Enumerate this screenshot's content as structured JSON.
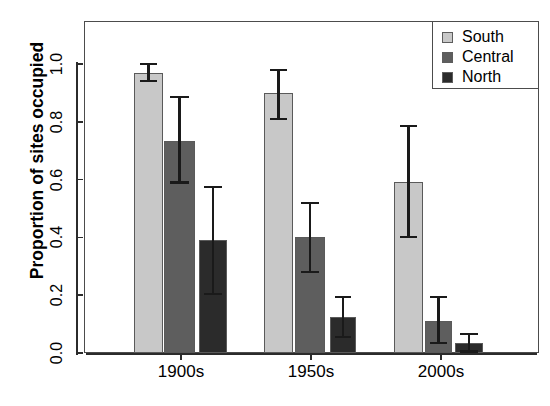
{
  "chart_data": {
    "type": "bar",
    "title": "",
    "xlabel": "",
    "ylabel": "Proportion of sites occupied",
    "categories": [
      "1900s",
      "1950s",
      "2000s"
    ],
    "ylim": [
      0.0,
      1.08
    ],
    "yticks": [
      "0.0",
      "0.2",
      "0.4",
      "0.6",
      "0.8",
      "1.0"
    ],
    "ytick_values": [
      0.0,
      0.2,
      0.4,
      0.6,
      0.8,
      1.0
    ],
    "grid": false,
    "legend_position": "top-right",
    "series": [
      {
        "name": "South",
        "color": "#c8c8c8",
        "values": [
          0.97,
          0.9,
          0.59
        ],
        "err_low": [
          0.94,
          0.81,
          0.4
        ],
        "err_high": [
          1.0,
          0.98,
          0.785
        ]
      },
      {
        "name": "Central",
        "color": "#5e5e5e",
        "values": [
          0.735,
          0.4,
          0.11
        ],
        "err_low": [
          0.59,
          0.28,
          0.035
        ],
        "err_high": [
          0.885,
          0.52,
          0.195
        ]
      },
      {
        "name": "North",
        "color": "#2b2b2b",
        "values": [
          0.39,
          0.125,
          0.035
        ],
        "err_low": [
          0.205,
          0.055,
          0.005
        ],
        "err_high": [
          0.575,
          0.195,
          0.065
        ]
      }
    ]
  },
  "legend": {
    "entries": [
      {
        "label": "South"
      },
      {
        "label": "Central"
      },
      {
        "label": "North"
      }
    ]
  },
  "axes": {
    "y_title": "Proportion of sites occupied",
    "y_ticks": [
      "0.0",
      "0.2",
      "0.4",
      "0.6",
      "0.8",
      "1.0"
    ],
    "x_ticks": [
      "1900s",
      "1950s",
      "2000s"
    ]
  },
  "colors": {
    "south": "#c8c8c8",
    "central": "#5e5e5e",
    "north": "#2b2b2b",
    "axis": "#2b2b2b",
    "frame": "#4c4c4c"
  }
}
